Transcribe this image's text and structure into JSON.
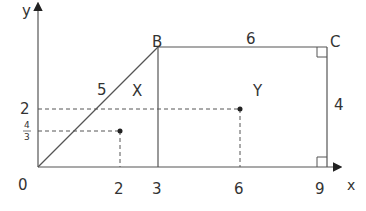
{
  "diagram": {
    "axes": {
      "x_label": "x",
      "y_label": "y",
      "origin_label": "0"
    },
    "x_ticks": [
      "2",
      "3",
      "6",
      "9"
    ],
    "y_ticks": {
      "two": "2",
      "four_thirds_num": "4",
      "four_thirds_den": "3"
    },
    "vertices": {
      "B": "B",
      "C": "C"
    },
    "side_labels": {
      "OB": "5",
      "BC": "6",
      "C9": "4"
    },
    "regions": {
      "triangle": "X",
      "rectangle": "Y"
    },
    "points": [
      {
        "name": "centroid-X",
        "x": 2,
        "y": "4/3"
      },
      {
        "name": "centroid-Y",
        "x": 6,
        "y": 2
      }
    ],
    "colors": {
      "line": "#555555",
      "text": "#333333"
    }
  }
}
